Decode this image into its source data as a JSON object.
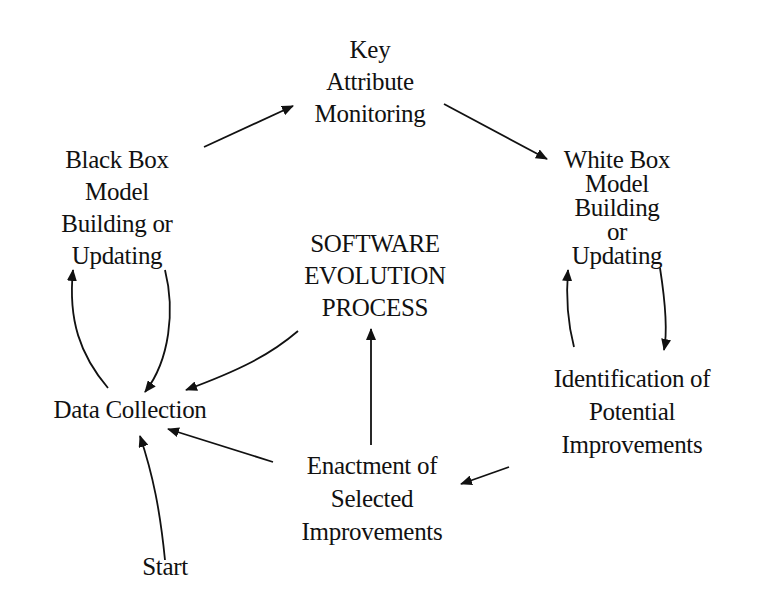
{
  "diagram": {
    "title": "Software Evolution Process",
    "colors": {
      "ink": "#111111",
      "background": "#ffffff"
    },
    "nodes": {
      "key_attribute": {
        "lines": [
          "Key",
          "Attribute",
          "Monitoring"
        ]
      },
      "black_box": {
        "lines": [
          "Black Box",
          "Model",
          "Building or",
          "Updating"
        ]
      },
      "white_box": {
        "lines": [
          "White Box",
          "Model",
          "Building",
          "or",
          "Updating"
        ]
      },
      "center": {
        "lines": [
          "SOFTWARE",
          "EVOLUTION",
          "PROCESS"
        ]
      },
      "identification": {
        "lines": [
          "Identification of",
          "Potential",
          "Improvements"
        ]
      },
      "data_collection": {
        "lines": [
          "Data Collection"
        ]
      },
      "enactment": {
        "lines": [
          "Enactment of",
          "Selected",
          "Improvements"
        ]
      },
      "start": {
        "lines": [
          "Start"
        ]
      }
    },
    "edges": [
      {
        "from": "Black Box Model Building or Updating",
        "to": "Key Attribute Monitoring"
      },
      {
        "from": "Key Attribute Monitoring",
        "to": "White Box Model Building or Updating"
      },
      {
        "from": "White Box Model Building or Updating",
        "to": "Identification of Potential Improvements"
      },
      {
        "from": "Identification of Potential Improvements",
        "to": "White Box Model Building or Updating"
      },
      {
        "from": "Identification of Potential Improvements",
        "to": "Enactment of Selected Improvements"
      },
      {
        "from": "Enactment of Selected Improvements",
        "to": "SOFTWARE EVOLUTION PROCESS"
      },
      {
        "from": "Enactment of Selected Improvements",
        "to": "Data Collection"
      },
      {
        "from": "SOFTWARE EVOLUTION PROCESS",
        "to": "Data Collection"
      },
      {
        "from": "Data Collection",
        "to": "Black Box Model Building or Updating"
      },
      {
        "from": "Black Box Model Building or Updating",
        "to": "Data Collection"
      },
      {
        "from": "Start",
        "to": "Data Collection"
      }
    ]
  }
}
